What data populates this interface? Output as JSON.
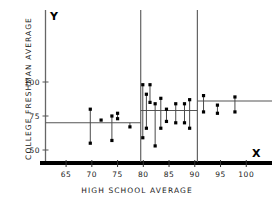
{
  "chart_data": {
    "type": "scatter",
    "title": "",
    "xlabel": "HIGH SCHOOL AVERAGE",
    "ylabel": "COLLEGE FRESHMAN AVERAGE",
    "xlim": [
      61,
      105
    ],
    "ylim": [
      42,
      112
    ],
    "grid": false,
    "legend": null,
    "x_ticks": [
      65,
      70,
      75,
      80,
      85,
      90,
      95,
      100
    ],
    "x_tick_labels": [
      "65",
      "70",
      "75",
      "80",
      "85",
      "90",
      "95",
      "100"
    ],
    "y_ticks": [
      50,
      75,
      100
    ],
    "y_tick_labels": [
      "50",
      "75",
      "100"
    ],
    "axis_letters": {
      "x": "X",
      "y": "Y"
    },
    "group_boundaries": [
      79.5,
      90.5
    ],
    "step_levels": [
      {
        "x_start": 61,
        "x_end": 79.5,
        "value": 70
      },
      {
        "x_start": 79.5,
        "x_end": 90.5,
        "value": 79
      },
      {
        "x_start": 90.5,
        "x_end": 105,
        "value": 86
      }
    ],
    "points": [
      {
        "x": 69.7,
        "y": 80
      },
      {
        "x": 69.7,
        "y": 55
      },
      {
        "x": 71.8,
        "y": 72
      },
      {
        "x": 73.9,
        "y": 75
      },
      {
        "x": 73.9,
        "y": 57
      },
      {
        "x": 75.0,
        "y": 77
      },
      {
        "x": 75.0,
        "y": 73
      },
      {
        "x": 77.4,
        "y": 67
      },
      {
        "x": 79.9,
        "y": 98
      },
      {
        "x": 79.9,
        "y": 59
      },
      {
        "x": 80.6,
        "y": 91
      },
      {
        "x": 80.6,
        "y": 66
      },
      {
        "x": 81.3,
        "y": 98
      },
      {
        "x": 81.3,
        "y": 85
      },
      {
        "x": 82.3,
        "y": 84
      },
      {
        "x": 82.3,
        "y": 53
      },
      {
        "x": 83.4,
        "y": 88
      },
      {
        "x": 83.4,
        "y": 66
      },
      {
        "x": 84.5,
        "y": 80
      },
      {
        "x": 84.5,
        "y": 71
      },
      {
        "x": 86.3,
        "y": 84
      },
      {
        "x": 86.3,
        "y": 70
      },
      {
        "x": 88.0,
        "y": 84
      },
      {
        "x": 88.0,
        "y": 70
      },
      {
        "x": 89.0,
        "y": 87
      },
      {
        "x": 89.0,
        "y": 66
      },
      {
        "x": 91.7,
        "y": 90
      },
      {
        "x": 91.7,
        "y": 78
      },
      {
        "x": 94.4,
        "y": 83
      },
      {
        "x": 94.4,
        "y": 77
      },
      {
        "x": 97.8,
        "y": 89
      },
      {
        "x": 97.8,
        "y": 78
      }
    ],
    "residual_pairs": [
      [
        69.7,
        55,
        80
      ],
      [
        73.9,
        57,
        75
      ],
      [
        75.0,
        73,
        77
      ],
      [
        77.4,
        67,
        70
      ],
      [
        79.9,
        59,
        98
      ],
      [
        80.6,
        66,
        91
      ],
      [
        81.3,
        85,
        98
      ],
      [
        82.3,
        53,
        84
      ],
      [
        83.4,
        66,
        88
      ],
      [
        84.5,
        71,
        80
      ],
      [
        86.3,
        70,
        84
      ],
      [
        88.0,
        70,
        84
      ],
      [
        89.0,
        66,
        87
      ],
      [
        91.7,
        78,
        90
      ],
      [
        94.4,
        77,
        83
      ],
      [
        97.8,
        78,
        89
      ]
    ],
    "colors": {
      "point": "#000000",
      "axis": "#000000",
      "step_line": "#555555",
      "divider": "#555555",
      "tick_text": "#1a1a1a"
    }
  }
}
